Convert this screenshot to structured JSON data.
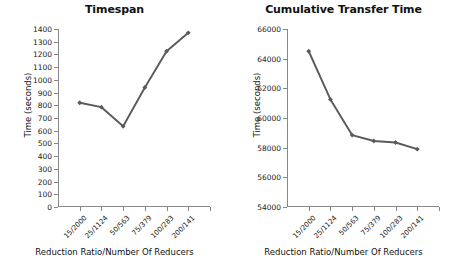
{
  "figure": {
    "background": "#ffffff",
    "line_color": "#5a5a5a",
    "axis_color": "#888888",
    "text_color": "#111111"
  },
  "chart_data": [
    {
      "type": "line",
      "title": "Timespan",
      "xlabel": "Reduction Ratio/Number Of Reducers",
      "ylabel": "Time (seconds)",
      "categories": [
        "15/2000",
        "25/1124",
        "50/563",
        "75/379",
        "100/283",
        "200/141"
      ],
      "values": [
        820,
        785,
        635,
        940,
        1225,
        1370
      ],
      "ylim": [
        0,
        1400
      ],
      "ytick_step": 100,
      "yticks": [
        0,
        100,
        200,
        300,
        400,
        500,
        600,
        700,
        800,
        900,
        1000,
        1100,
        1200,
        1300,
        1400
      ],
      "ytick_labels": [
        "0",
        "100",
        "200",
        "300",
        "400",
        "500",
        "600",
        "700",
        "800",
        "900",
        "1000",
        "1100",
        "1200",
        "1300",
        "1400"
      ],
      "grid": false,
      "legend": "none",
      "marker": "diamond",
      "series": [
        {
          "name": "Timespan",
          "values": [
            820,
            785,
            635,
            940,
            1225,
            1370
          ]
        }
      ]
    },
    {
      "type": "line",
      "title": "Cumulative Transfer Time",
      "xlabel": "Reduction Ratio/Number Of Reducers",
      "ylabel": "Time (seconds)",
      "categories": [
        "15/2000",
        "25/1124",
        "50/563",
        "75/379",
        "100/283",
        "200/141"
      ],
      "values": [
        64500,
        61250,
        58850,
        58450,
        58350,
        57900
      ],
      "ylim": [
        54000,
        66000
      ],
      "ytick_step": 2000,
      "yticks": [
        54000,
        56000,
        58000,
        60000,
        62000,
        64000,
        66000
      ],
      "ytick_labels": [
        "54000",
        "56000",
        "58000",
        "60000",
        "62000",
        "64000",
        "66000"
      ],
      "grid": false,
      "legend": "none",
      "marker": "diamond",
      "series": [
        {
          "name": "Cumulative Transfer Time",
          "values": [
            64500,
            61250,
            58850,
            58450,
            58350,
            57900
          ]
        }
      ]
    }
  ]
}
